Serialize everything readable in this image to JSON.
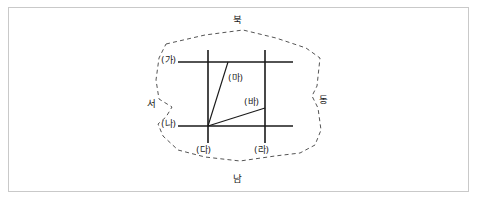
{
  "figure": {
    "type": "line-diagram",
    "background_color": "#ffffff",
    "frame_border_color": "#c9c9c9",
    "line_color": "#1a1a1a",
    "dashed_color": "#555555"
  },
  "directions": {
    "north": "북",
    "south": "남",
    "west": "서",
    "east": "동"
  },
  "lines": [
    {
      "id": "ga",
      "label": "(가)",
      "orientation": "horizontal",
      "note": "upper horizontal line"
    },
    {
      "id": "na",
      "label": "(나)",
      "orientation": "horizontal",
      "note": "lower horizontal line"
    },
    {
      "id": "da",
      "label": "(다)",
      "orientation": "vertical",
      "note": "left vertical line"
    },
    {
      "id": "ra",
      "label": "(라)",
      "orientation": "vertical",
      "note": "right vertical line"
    },
    {
      "id": "ma",
      "label": "(마)",
      "orientation": "diagonal",
      "note": "steep diagonal from lower-left corner up to the (가) line"
    },
    {
      "id": "ba",
      "label": "(바)",
      "orientation": "diagonal",
      "note": "shallow diagonal from lower-left corner to the (라) line"
    }
  ],
  "boundary": {
    "style": "dashed",
    "shape": "irregular polygon with notches on the west and east sides"
  }
}
